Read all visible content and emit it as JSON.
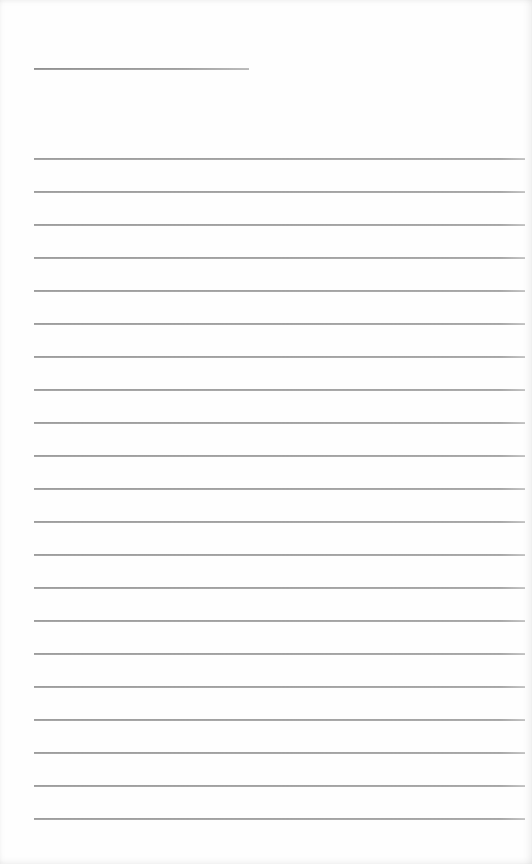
{
  "document": {
    "type": "lined-paper",
    "background_color": "#fefefe",
    "line_color": "#a0a0a0",
    "title_line": {
      "x_start": 34,
      "x_end": 249,
      "y": 68,
      "text": ""
    },
    "ruled_lines": {
      "count": 21,
      "x_start": 34,
      "x_end": 525,
      "first_y": 158,
      "spacing": 33,
      "lines": [
        {
          "y": 158,
          "text": ""
        },
        {
          "y": 191,
          "text": ""
        },
        {
          "y": 224,
          "text": ""
        },
        {
          "y": 257,
          "text": ""
        },
        {
          "y": 290,
          "text": ""
        },
        {
          "y": 323,
          "text": ""
        },
        {
          "y": 356,
          "text": ""
        },
        {
          "y": 389,
          "text": ""
        },
        {
          "y": 422,
          "text": ""
        },
        {
          "y": 455,
          "text": ""
        },
        {
          "y": 488,
          "text": ""
        },
        {
          "y": 521,
          "text": ""
        },
        {
          "y": 554,
          "text": ""
        },
        {
          "y": 587,
          "text": ""
        },
        {
          "y": 620,
          "text": ""
        },
        {
          "y": 653,
          "text": ""
        },
        {
          "y": 686,
          "text": ""
        },
        {
          "y": 719,
          "text": ""
        },
        {
          "y": 752,
          "text": ""
        },
        {
          "y": 785,
          "text": ""
        },
        {
          "y": 818,
          "text": ""
        }
      ]
    }
  }
}
